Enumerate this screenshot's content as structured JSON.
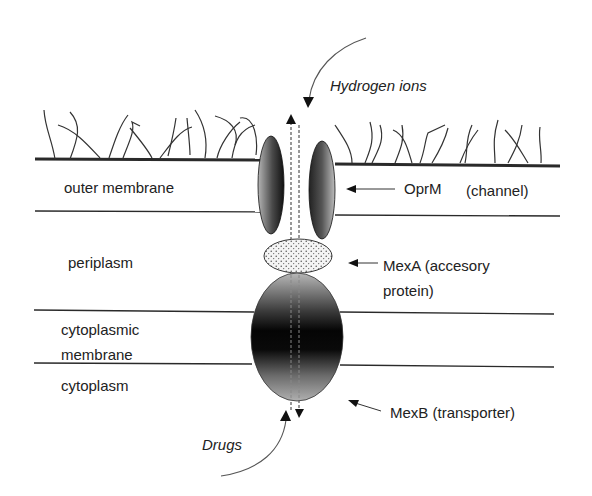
{
  "diagram": {
    "regions": {
      "outer_membrane": "outer membrane",
      "periplasm": "periplasm",
      "cytoplasmic_membrane_line1": "cytoplasmic",
      "cytoplasmic_membrane_line2": "membrane",
      "cytoplasm": "cytoplasm"
    },
    "components": {
      "oprm": {
        "name": "OprM",
        "role": "(channel)"
      },
      "mexa": {
        "line1": "MexA (accesory",
        "line2": "protein)"
      },
      "mexb": {
        "label": "MexB (transporter)"
      }
    },
    "flows": {
      "hydrogen": "Hydrogen ions",
      "drugs": "Drugs"
    },
    "colors": {
      "line": "#2a2a2a",
      "protein_dark": "#0a0a0a",
      "protein_light": "#a0a0a0",
      "stipple": "#555555"
    }
  }
}
